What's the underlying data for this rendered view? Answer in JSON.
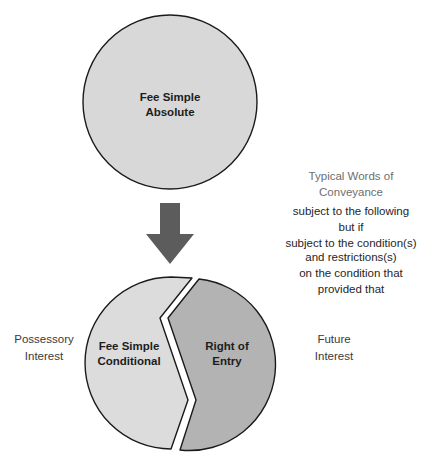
{
  "diagram": {
    "colors": {
      "top_circle_fill": "#d8d8d8",
      "left_segment_fill": "#dcdcdc",
      "right_segment_fill": "#b3b3b3",
      "outline": "#1a1a1a",
      "arrow_fill": "#5c5c5c",
      "heading_text": "#6e6e6e",
      "body_text": "#262626",
      "background": "#ffffff"
    },
    "top_shape": {
      "name": "fee-simple-absolute-circle",
      "label_line1": "Fee Simple",
      "label_line2": "Absolute"
    },
    "arrow": {
      "name": "down-arrow-icon",
      "direction": "down"
    },
    "bottom_shape": {
      "name": "split-circle",
      "left_segment": {
        "label_line1": "Fee Simple",
        "label_line2": "Conditional"
      },
      "right_segment": {
        "label_line1": "Right of",
        "label_line2": "Entry"
      }
    },
    "side_labels": {
      "left_line1": "Possessory",
      "left_line2": "Interest",
      "right_line1": "Future",
      "right_line2": "Interest"
    },
    "legend": {
      "heading_line1": "Typical Words of",
      "heading_line2": "Conveyance",
      "phrases": [
        "subject to the following",
        "but if",
        "subject to the condition(s)",
        "and restrictions(s)",
        "on the condition that",
        "provided that"
      ]
    }
  }
}
